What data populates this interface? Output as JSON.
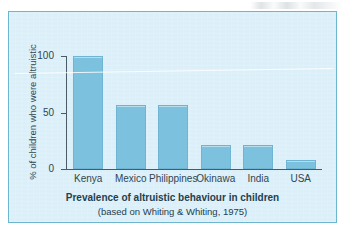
{
  "chart_data": {
    "type": "bar",
    "title": "Prevalence of altruistic behaviour in children",
    "subtitle": "(based on Whiting & Whiting, 1975)",
    "xlabel": "",
    "ylabel": "% of children who were altruistic",
    "categories": [
      "Kenya",
      "Mexico",
      "Philippines",
      "Okinawa",
      "India",
      "USA"
    ],
    "values": [
      100,
      57,
      57,
      21,
      21,
      8
    ],
    "ylim": [
      0,
      100
    ],
    "yticks": [
      0,
      50,
      100
    ],
    "ytick_labels": [
      "0",
      "50",
      "100"
    ],
    "grid": false,
    "legend": false,
    "bar_color": "#7cc1de",
    "panel_color": "#dbeff8",
    "axis_color": "#4a5b66",
    "text_color": "#2f4652"
  }
}
